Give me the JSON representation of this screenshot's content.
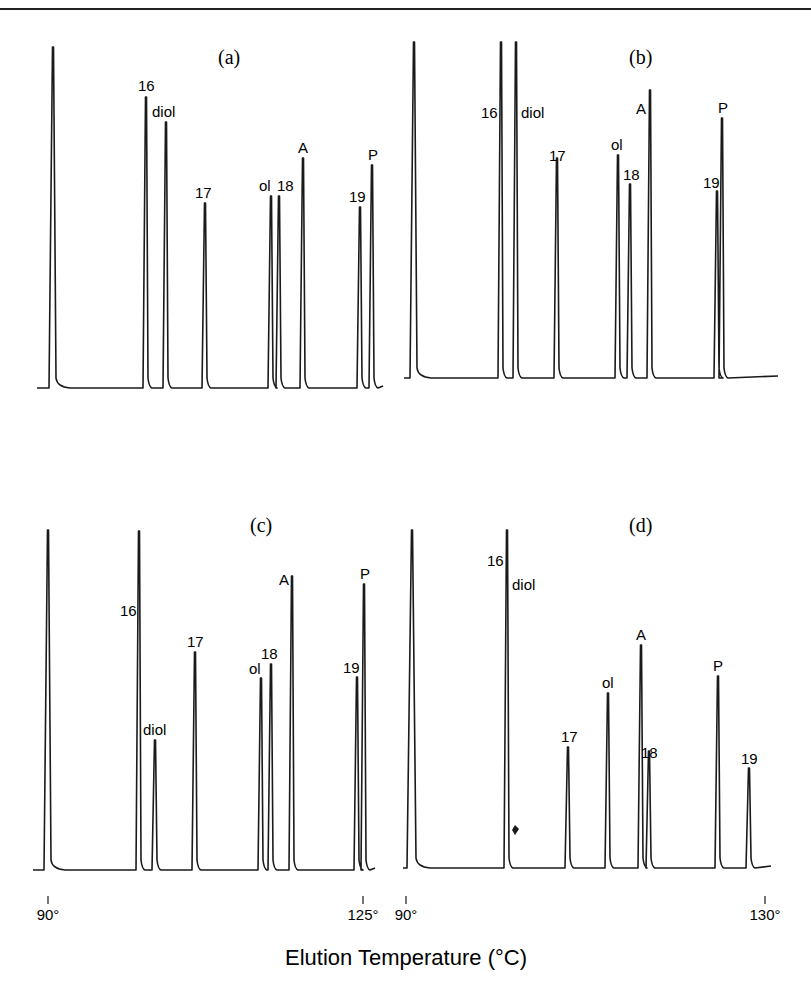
{
  "header": {
    "fragment": "…ograph…"
  },
  "chart_data": {
    "type": "line",
    "title": "",
    "xlabel": "Elution Temperature (°C)",
    "ylabel": "",
    "panels": [
      {
        "id": "a",
        "label": "(a)",
        "box": {
          "x0": 37,
          "x1": 383,
          "baseline": 388
        },
        "peaks": [
          {
            "name": "solvent",
            "label": "",
            "x": 53,
            "top": 47,
            "w": 3
          },
          {
            "name": "16",
            "label": "16",
            "x": 146,
            "top": 97,
            "w": 2
          },
          {
            "name": "diol",
            "label": "diol",
            "x": 166,
            "top": 122,
            "w": 2
          },
          {
            "name": "17",
            "label": "17",
            "x": 205,
            "top": 203,
            "w": 2
          },
          {
            "name": "ol",
            "label": "ol",
            "x": 271,
            "top": 196,
            "w": 2
          },
          {
            "name": "18",
            "label": "18",
            "x": 279,
            "top": 196,
            "w": 2
          },
          {
            "name": "A",
            "label": "A",
            "x": 303,
            "top": 158,
            "w": 2
          },
          {
            "name": "19",
            "label": "19",
            "x": 360,
            "top": 207,
            "w": 2
          },
          {
            "name": "P",
            "label": "P",
            "x": 372,
            "top": 165,
            "w": 2
          }
        ],
        "labels": [
          {
            "text": "16",
            "x": 138,
            "y": 91
          },
          {
            "text": "diol",
            "x": 152,
            "y": 117
          },
          {
            "text": "17",
            "x": 195,
            "y": 198
          },
          {
            "text": "ol",
            "x": 259,
            "y": 191
          },
          {
            "text": "18",
            "x": 277,
            "y": 191
          },
          {
            "text": "A",
            "x": 298,
            "y": 153
          },
          {
            "text": "19",
            "x": 349,
            "y": 202
          },
          {
            "text": "P",
            "x": 368,
            "y": 160
          }
        ],
        "label_pos": {
          "x": 218,
          "y": 64
        }
      },
      {
        "id": "b",
        "label": "(b)",
        "box": {
          "x0": 404,
          "x1": 778,
          "baseline": 378
        },
        "peaks": [
          {
            "name": "solvent",
            "label": "",
            "x": 414,
            "top": 42,
            "w": 3
          },
          {
            "name": "16",
            "label": "16",
            "x": 501,
            "top": 42,
            "w": 2
          },
          {
            "name": "diol",
            "label": "diol",
            "x": 516,
            "top": 42,
            "w": 2
          },
          {
            "name": "17",
            "label": "17",
            "x": 557,
            "top": 158,
            "w": 2
          },
          {
            "name": "ol",
            "label": "ol",
            "x": 618,
            "top": 155,
            "w": 2
          },
          {
            "name": "18",
            "label": "18",
            "x": 630,
            "top": 184,
            "w": 2
          },
          {
            "name": "A",
            "label": "A",
            "x": 650,
            "top": 90,
            "w": 2
          },
          {
            "name": "19",
            "label": "19",
            "x": 717,
            "top": 191,
            "w": 2
          },
          {
            "name": "P",
            "label": "P",
            "x": 722,
            "top": 118,
            "w": 2
          }
        ],
        "labels": [
          {
            "text": "16",
            "x": 481,
            "y": 118
          },
          {
            "text": "diol",
            "x": 521,
            "y": 118
          },
          {
            "text": "17",
            "x": 549,
            "y": 161
          },
          {
            "text": "ol",
            "x": 611,
            "y": 150
          },
          {
            "text": "18",
            "x": 623,
            "y": 180
          },
          {
            "text": "A",
            "x": 636,
            "y": 114
          },
          {
            "text": "19",
            "x": 703,
            "y": 188
          },
          {
            "text": "P",
            "x": 718,
            "y": 113
          }
        ],
        "label_pos": {
          "x": 629,
          "y": 64
        }
      },
      {
        "id": "c",
        "label": "(c)",
        "box": {
          "x0": 33,
          "x1": 375,
          "baseline": 870
        },
        "peaks": [
          {
            "name": "solvent",
            "label": "",
            "x": 48,
            "top": 530,
            "w": 3
          },
          {
            "name": "16",
            "label": "16",
            "x": 139,
            "top": 531,
            "w": 2
          },
          {
            "name": "diol",
            "label": "diol",
            "x": 155,
            "top": 740,
            "w": 2
          },
          {
            "name": "17",
            "label": "17",
            "x": 195,
            "top": 652,
            "w": 2
          },
          {
            "name": "ol",
            "label": "ol",
            "x": 261,
            "top": 678,
            "w": 2
          },
          {
            "name": "18",
            "label": "18",
            "x": 271,
            "top": 664,
            "w": 2
          },
          {
            "name": "A",
            "label": "A",
            "x": 292,
            "top": 576,
            "w": 2
          },
          {
            "name": "19",
            "label": "19",
            "x": 357,
            "top": 677,
            "w": 2
          },
          {
            "name": "P",
            "label": "P",
            "x": 364,
            "top": 584,
            "w": 2
          }
        ],
        "labels": [
          {
            "text": "16",
            "x": 120,
            "y": 616
          },
          {
            "text": "diol",
            "x": 143,
            "y": 735
          },
          {
            "text": "17",
            "x": 187,
            "y": 647
          },
          {
            "text": "ol",
            "x": 249,
            "y": 674
          },
          {
            "text": "18",
            "x": 261,
            "y": 659
          },
          {
            "text": "A",
            "x": 279,
            "y": 585
          },
          {
            "text": "19",
            "x": 343,
            "y": 673
          },
          {
            "text": "P",
            "x": 360,
            "y": 579
          }
        ],
        "label_pos": {
          "x": 250,
          "y": 532
        }
      },
      {
        "id": "d",
        "label": "(d)",
        "box": {
          "x0": 403,
          "x1": 771,
          "baseline": 868
        },
        "peaks": [
          {
            "name": "solvent",
            "label": "",
            "x": 412,
            "top": 530,
            "w": 4
          },
          {
            "name": "16",
            "label": "16",
            "x": 507,
            "top": 530,
            "w": 2
          },
          {
            "name": "17",
            "label": "17",
            "x": 568,
            "top": 747,
            "w": 2
          },
          {
            "name": "ol",
            "label": "ol",
            "x": 608,
            "top": 693,
            "w": 2
          },
          {
            "name": "A",
            "label": "A",
            "x": 641,
            "top": 645,
            "w": 2
          },
          {
            "name": "18",
            "label": "18",
            "x": 649,
            "top": 751,
            "w": 2
          },
          {
            "name": "P",
            "label": "P",
            "x": 718,
            "top": 676,
            "w": 2
          },
          {
            "name": "19",
            "label": "19",
            "x": 749,
            "top": 768,
            "w": 2
          }
        ],
        "labels": [
          {
            "text": "16",
            "x": 487,
            "y": 566
          },
          {
            "text": "diol",
            "x": 512,
            "y": 590
          },
          {
            "text": "17",
            "x": 561,
            "y": 742
          },
          {
            "text": "ol",
            "x": 602,
            "y": 688
          },
          {
            "text": "A",
            "x": 636,
            "y": 640
          },
          {
            "text": "18",
            "x": 641,
            "y": 758
          },
          {
            "text": "P",
            "x": 713,
            "y": 671
          },
          {
            "text": "19",
            "x": 741,
            "y": 764
          }
        ],
        "label_pos": {
          "x": 629,
          "y": 532
        }
      }
    ],
    "x_ticks": [
      {
        "label": "90°",
        "x": 48,
        "panel": "c"
      },
      {
        "label": "125°",
        "x": 363,
        "panel": "c"
      },
      {
        "label": "90°",
        "x": 406,
        "panel": "d"
      },
      {
        "label": "130°",
        "x": 765,
        "panel": "d"
      }
    ],
    "x_ranges": {
      "c": [
        90,
        125
      ],
      "d": [
        90,
        130
      ]
    },
    "legend": null,
    "grid": false
  }
}
